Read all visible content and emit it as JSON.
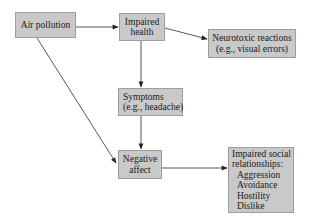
{
  "diagram": {
    "type": "flowchart",
    "colors": {
      "node_fill": "#c9c9c9",
      "node_border": "#9e9e9e",
      "edge": "#333333",
      "background": "#ffffff"
    },
    "nodes": {
      "air_pollution": {
        "lines": [
          "Air pollution"
        ]
      },
      "impaired_health": {
        "lines": [
          "Impaired",
          "health"
        ]
      },
      "neurotoxic": {
        "lines": [
          "Neurotoxic reactions",
          "(e.g., visual errors)"
        ]
      },
      "symptoms": {
        "lines": [
          "Symptoms",
          "(e.g., headache)"
        ]
      },
      "negative_affect": {
        "lines": [
          "Negative",
          "affect"
        ]
      },
      "impaired_social": {
        "lines": [
          "Impaired social",
          "relationships:"
        ],
        "items": [
          "Aggression",
          "Avoidance",
          "Hostility",
          "Dislike"
        ]
      }
    },
    "edges": [
      {
        "from": "Air pollution",
        "to": "Impaired health"
      },
      {
        "from": "Impaired health",
        "to": "Neurotoxic reactions (e.g., visual errors)"
      },
      {
        "from": "Impaired health",
        "to": "Symptoms (e.g., headache)"
      },
      {
        "from": "Symptoms (e.g., headache)",
        "to": "Negative affect"
      },
      {
        "from": "Air pollution",
        "to": "Negative affect"
      },
      {
        "from": "Negative affect",
        "to": "Impaired social relationships"
      }
    ]
  }
}
